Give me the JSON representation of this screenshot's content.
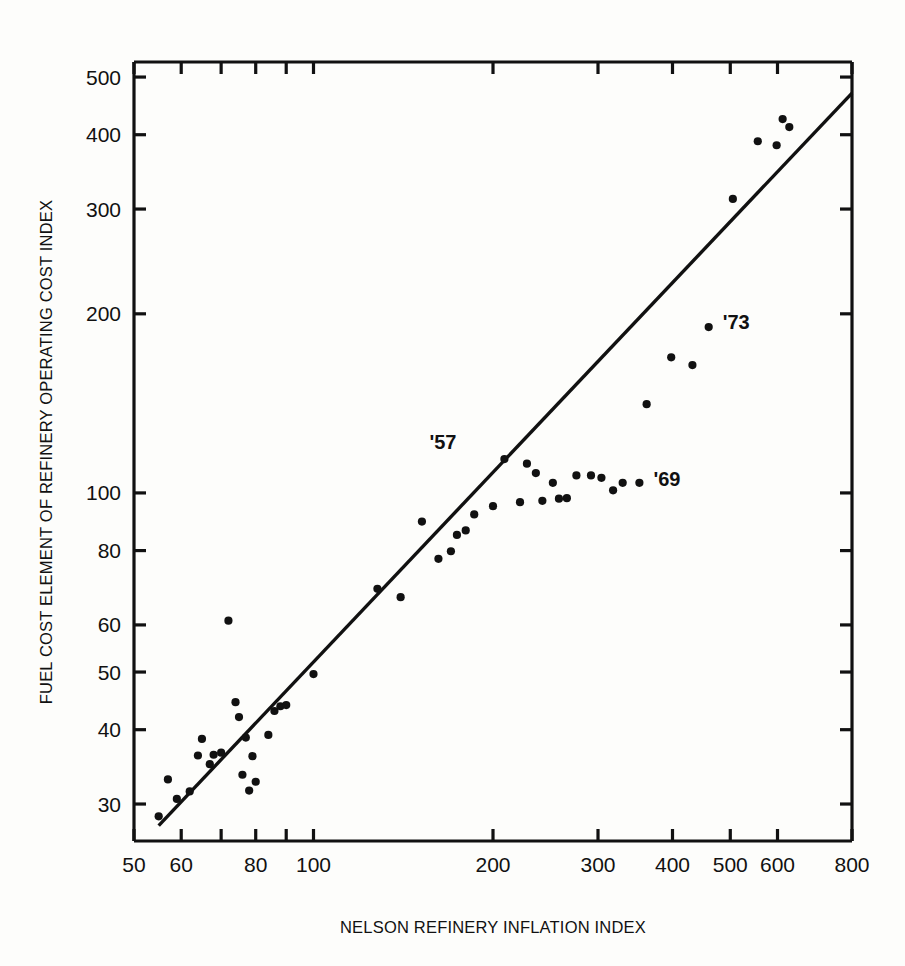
{
  "chart_data": {
    "type": "scatter",
    "title": "",
    "xlabel": "NELSON REFINERY INFLATION INDEX",
    "ylabel": "FUEL COST ELEMENT OF REFINERY OPERATING COST INDEX",
    "xscale": "log",
    "yscale": "log",
    "xlim": [
      50,
      800
    ],
    "ylim": [
      26,
      530
    ],
    "grid": false,
    "legend": null,
    "xticks": [
      {
        "value": 50,
        "label": "50"
      },
      {
        "value": 60,
        "label": "60"
      },
      {
        "value": 70,
        "label": ""
      },
      {
        "value": 80,
        "label": "80"
      },
      {
        "value": 90,
        "label": ""
      },
      {
        "value": 100,
        "label": "100"
      },
      {
        "value": 200,
        "label": "200"
      },
      {
        "value": 300,
        "label": "300"
      },
      {
        "value": 400,
        "label": "400"
      },
      {
        "value": 500,
        "label": "500"
      },
      {
        "value": 600,
        "label": "600"
      },
      {
        "value": 800,
        "label": "800"
      }
    ],
    "yticks": [
      {
        "value": 30,
        "label": "30"
      },
      {
        "value": 40,
        "label": "40"
      },
      {
        "value": 50,
        "label": "50"
      },
      {
        "value": 60,
        "label": "60"
      },
      {
        "value": 80,
        "label": "80"
      },
      {
        "value": 100,
        "label": "100"
      },
      {
        "value": 200,
        "label": "200"
      },
      {
        "value": 300,
        "label": "300"
      },
      {
        "value": 400,
        "label": "400"
      },
      {
        "value": 500,
        "label": "500"
      }
    ],
    "series": [
      {
        "name": "Fuel cost element vs Nelson index",
        "marker": "circle",
        "color": "#111111",
        "points": [
          [
            55,
            28.6
          ],
          [
            57,
            33.0
          ],
          [
            59,
            30.6
          ],
          [
            62,
            31.5
          ],
          [
            64,
            36.2
          ],
          [
            65,
            38.6
          ],
          [
            67,
            35.0
          ],
          [
            68,
            36.3
          ],
          [
            70,
            36.6
          ],
          [
            72,
            61.0
          ],
          [
            74,
            44.5
          ],
          [
            75,
            42.0
          ],
          [
            76,
            33.6
          ],
          [
            77,
            38.8
          ],
          [
            78,
            31.6
          ],
          [
            79,
            36.1
          ],
          [
            80,
            32.7
          ],
          [
            84,
            39.2
          ],
          [
            86,
            43.0
          ],
          [
            88,
            43.8
          ],
          [
            90,
            44.0
          ],
          [
            100,
            49.6
          ],
          [
            128,
            69.0
          ],
          [
            140,
            66.8
          ],
          [
            152,
            89.5
          ],
          [
            162,
            77.5
          ],
          [
            170,
            79.8
          ],
          [
            174,
            85.0
          ],
          [
            180,
            86.5
          ],
          [
            186,
            92.0
          ],
          [
            200,
            95.0
          ],
          [
            209,
            114.0
          ],
          [
            222,
            96.5
          ],
          [
            228,
            112.0
          ],
          [
            236,
            108.0
          ],
          [
            242,
            97.0
          ],
          [
            252,
            104.0
          ],
          [
            258,
            97.8
          ],
          [
            266,
            98.0
          ],
          [
            276,
            107.0
          ],
          [
            292,
            107.0
          ],
          [
            304,
            106.0
          ],
          [
            318,
            101.0
          ],
          [
            330,
            104.0
          ],
          [
            352,
            104.0
          ],
          [
            362,
            141.0
          ],
          [
            398,
            169.0
          ],
          [
            432,
            164.0
          ],
          [
            460,
            190.0
          ],
          [
            505,
            312.0
          ],
          [
            556,
            390.0
          ],
          [
            598,
            384.0
          ],
          [
            612,
            425.0
          ],
          [
            628,
            412.0
          ]
        ]
      }
    ],
    "fit_line": {
      "name": "regression-line",
      "x_start": 55,
      "y_start": 27.6,
      "x_end": 800,
      "y_end": 470.0,
      "color": "#111111"
    },
    "annotations": [
      {
        "text": "'57",
        "x": 209,
        "y": 114,
        "dx": -48,
        "dy": -10
      },
      {
        "text": "'69",
        "x": 352,
        "y": 104,
        "dx": 14,
        "dy": 3
      },
      {
        "text": "'73",
        "x": 460,
        "y": 190,
        "dx": 14,
        "dy": 2
      }
    ]
  }
}
